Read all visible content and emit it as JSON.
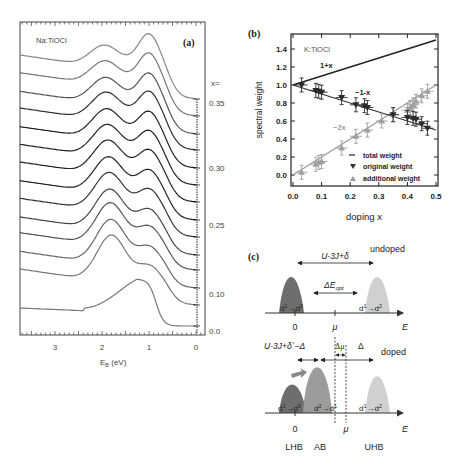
{
  "header_cut_text": "",
  "chart_data": [
    {
      "panel": "(a)",
      "type": "line",
      "title": "Na:TiOCl",
      "xlabel": "E_B (eV)",
      "xlabel_main": "E",
      "xlabel_sub": "B",
      "xlabel_unit": " (eV)",
      "xlim": [
        3.8,
        -0.15
      ],
      "xticks": [
        "3",
        "2",
        "1",
        "0"
      ],
      "right_label_header": "x=",
      "right_labels": [
        "0.35",
        "0.30",
        "0.25",
        "0.10",
        "0.0"
      ],
      "num_curves": 14,
      "description": "Stacked photoemission spectra vs binding energy for doping x from 0.0 (bottom) to 0.35 (top); peaks near 1.9 eV and 1.0 eV; bottom x=0.0 curve single peak near 1.2 eV"
    },
    {
      "panel": "(b)",
      "type": "scatter",
      "title": "K:TiOCl",
      "xlabel": "doping x",
      "ylabel": "spectral weight",
      "xlim": [
        0.0,
        0.5
      ],
      "ylim": [
        -0.1,
        1.55
      ],
      "xticks": [
        "0.0",
        "0.1",
        "0.2",
        "0.3",
        "0.4",
        "0.5"
      ],
      "yticks": [
        "0.0",
        "0.2",
        "0.4",
        "0.6",
        "0.8",
        "1.0",
        "1.2",
        "1.4"
      ],
      "annotations": [
        "1+x",
        "~1-x",
        "~2x"
      ],
      "legend": [
        "total weight",
        "original weight",
        "additional weight"
      ],
      "series": [
        {
          "name": "total weight",
          "kind": "line",
          "x": [
            0.0,
            0.5
          ],
          "y": [
            1.0,
            1.5
          ]
        },
        {
          "name": "original weight",
          "kind": "down-triangle",
          "x": [
            0.03,
            0.08,
            0.09,
            0.1,
            0.17,
            0.22,
            0.25,
            0.26,
            0.35,
            0.4,
            0.42,
            0.43,
            0.45,
            0.47
          ],
          "y": [
            1.0,
            0.94,
            0.93,
            0.92,
            0.86,
            0.78,
            0.77,
            0.75,
            0.67,
            0.64,
            0.63,
            0.62,
            0.57,
            0.52
          ]
        },
        {
          "name": "additional weight",
          "kind": "up-triangle",
          "x": [
            0.03,
            0.08,
            0.09,
            0.1,
            0.17,
            0.22,
            0.26,
            0.31,
            0.35,
            0.4,
            0.41,
            0.42,
            0.43,
            0.45,
            0.47
          ],
          "y": [
            0.03,
            0.12,
            0.14,
            0.15,
            0.3,
            0.43,
            0.5,
            0.6,
            0.67,
            0.72,
            0.75,
            0.78,
            0.82,
            0.88,
            0.93
          ]
        }
      ]
    },
    {
      "panel": "(c)",
      "type": "diagram",
      "undoped": {
        "label": "undoped",
        "gap_label_main": "U-3J+δ",
        "opt_label_main": "ΔE",
        "opt_label_sub": "opt",
        "lhb_label": [
          "d",
          "1",
          "→d",
          "0"
        ],
        "uhb_label": [
          "d",
          "1",
          "→d",
          "2"
        ],
        "axis_labels": [
          "0",
          "μ",
          "E"
        ]
      },
      "doped": {
        "label": "doped",
        "gap_label": "U-3J+δ´−Δ",
        "dmu_label": "Δμ",
        "delta_label": "Δ",
        "lhb_label": [
          "d",
          "1",
          "→d",
          "0"
        ],
        "ab_label": [
          "d",
          "2",
          "→d",
          "1"
        ],
        "uhb_label": [
          "d",
          "1",
          "→d",
          "2"
        ],
        "axis_labels": [
          "0",
          "μ",
          "E"
        ],
        "band_names": [
          "LHB",
          "AB",
          "UHB"
        ]
      }
    }
  ]
}
